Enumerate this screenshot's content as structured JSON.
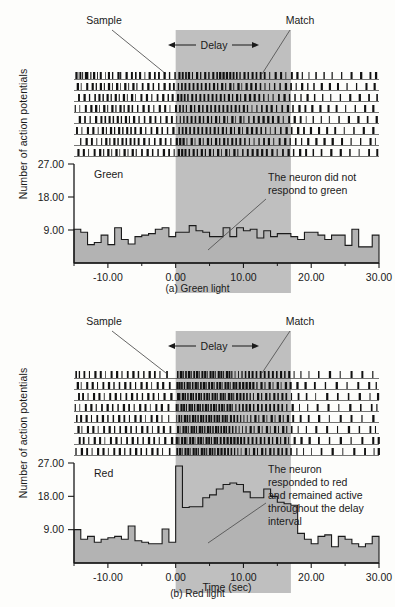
{
  "figure": {
    "y_axis_label": "Number of action potentials",
    "x_axis_label": "Time (sec)"
  },
  "panels": [
    {
      "id": "green",
      "caption": "(a) Green light",
      "condition_label": "Green",
      "annotation_lines": [
        "The neuron did not",
        "respond to green"
      ],
      "markers": {
        "sample": "Sample",
        "delay": "Delay",
        "match": "Match"
      }
    },
    {
      "id": "red",
      "caption": "(b) Red light",
      "condition_label": "Red",
      "annotation_lines": [
        "The neuron",
        "responded to red",
        "and remained active",
        "throughout the delay",
        "interval"
      ],
      "markers": {
        "sample": "Sample",
        "delay": "Delay",
        "match": "Match"
      }
    }
  ],
  "chart_data": [
    {
      "type": "bar",
      "id": "green-histogram",
      "title": "Green",
      "xlabel": "Time (sec)",
      "ylabel": "Number of action potentials",
      "xlim": [
        -15,
        30
      ],
      "ylim": [
        0,
        27
      ],
      "xticks": [
        -10,
        0,
        10,
        20,
        30
      ],
      "xtick_labels": [
        "-10.00",
        "0.00",
        "10.00",
        "20.00",
        "30.00"
      ],
      "yticks": [
        9,
        18,
        27
      ],
      "ytick_labels": [
        "9.00",
        "18.00",
        "27.00"
      ],
      "minor_xticks": [
        -15,
        -5,
        5,
        15,
        25
      ],
      "bin_width": 1,
      "bin_starts": [
        -15,
        -14,
        -13,
        -12,
        -11,
        -10,
        -9,
        -8,
        -7,
        -6,
        -5,
        -4,
        -3,
        -2,
        -1,
        0,
        1,
        2,
        3,
        4,
        5,
        6,
        7,
        8,
        9,
        10,
        11,
        12,
        13,
        14,
        15,
        16,
        17,
        18,
        19,
        20,
        21,
        22,
        23,
        24,
        25,
        26,
        27,
        28,
        29
      ],
      "values": [
        9.2,
        8.4,
        5.0,
        5.6,
        7.6,
        5.0,
        9.6,
        6.4,
        5.2,
        7.2,
        7.6,
        8.0,
        9.2,
        9.6,
        7.2,
        8.4,
        8.4,
        10.2,
        8.8,
        8.4,
        7.2,
        7.2,
        9.6,
        7.2,
        9.6,
        8.8,
        9.2,
        6.8,
        8.8,
        7.2,
        8.0,
        8.0,
        7.2,
        6.4,
        8.4,
        8.4,
        7.6,
        6.4,
        7.6,
        7.6,
        4.8,
        9.2,
        4.4,
        4.4,
        7.6
      ],
      "shaded_region": {
        "label": "Delay",
        "x_start": 0,
        "x_end": 17
      },
      "grid": false,
      "annotation": "The neuron did not respond to green"
    },
    {
      "type": "bar",
      "id": "red-histogram",
      "title": "Red",
      "xlabel": "Time (sec)",
      "ylabel": "Number of action potentials",
      "xlim": [
        -15,
        30
      ],
      "ylim": [
        0,
        27
      ],
      "xticks": [
        -10,
        0,
        10,
        20,
        30
      ],
      "xtick_labels": [
        "-10.00",
        "0.00",
        "10.00",
        "20.00",
        "30.00"
      ],
      "yticks": [
        9,
        18,
        27
      ],
      "ytick_labels": [
        "9.00",
        "18.00",
        "27.00"
      ],
      "minor_xticks": [
        -15,
        -5,
        5,
        15,
        25
      ],
      "bin_width": 1,
      "bin_starts": [
        -15,
        -14,
        -13,
        -12,
        -11,
        -10,
        -9,
        -8,
        -7,
        -6,
        -5,
        -4,
        -3,
        -2,
        -1,
        0,
        1,
        2,
        3,
        4,
        5,
        6,
        7,
        8,
        9,
        10,
        11,
        12,
        13,
        14,
        15,
        16,
        17,
        18,
        19,
        20,
        21,
        22,
        23,
        24,
        25,
        26,
        27,
        28,
        29
      ],
      "values": [
        9.0,
        6.4,
        7.2,
        5.6,
        6.4,
        6.8,
        7.2,
        6.4,
        10.0,
        6.0,
        5.6,
        5.2,
        5.2,
        9.2,
        5.6,
        26.2,
        15.0,
        15.2,
        15.2,
        17.6,
        18.4,
        20.0,
        21.2,
        21.6,
        21.2,
        19.2,
        17.6,
        17.6,
        20.0,
        18.0,
        16.4,
        16.0,
        15.6,
        8.0,
        6.4,
        5.2,
        7.2,
        7.6,
        4.4,
        7.2,
        6.4,
        5.2,
        4.4,
        5.2,
        7.2
      ],
      "shaded_region": {
        "label": "Delay",
        "x_start": 0,
        "x_end": 17
      },
      "grid": false,
      "annotation": "The neuron responded to red and remained active throughout the delay interval"
    }
  ],
  "raster": {
    "rows": 8,
    "green": [
      [
        -14.8,
        -14.5,
        -14.2,
        -13.8,
        -13.4,
        -13.1,
        -12.6,
        -12.2,
        -11.6,
        -11.2,
        -10.4,
        -10.0,
        -9.4,
        -8.6,
        -8.2,
        -7.4,
        -6.6,
        -6.0,
        -5.4,
        -4.6,
        -4.0,
        -3.2,
        -2.6,
        -1.8,
        -1.0,
        -0.2,
        0.4,
        0.9,
        1.4,
        1.8,
        2.4,
        3.0,
        3.6,
        4.2,
        4.8,
        5.4,
        6.0,
        6.4,
        6.9,
        7.4,
        7.9,
        8.4,
        8.9,
        9.4,
        10.0,
        10.6,
        11.2,
        11.8,
        12.4,
        13.0,
        13.8,
        14.6,
        15.4,
        16.2,
        17.0,
        17.8,
        18.6,
        19.6,
        20.6,
        21.8,
        23.0,
        24.4,
        25.8,
        27.2,
        28.6,
        29.4
      ],
      [
        -14.6,
        -14.0,
        -13.2,
        -12.4,
        -11.8,
        -11.2,
        -10.6,
        -10.0,
        -9.4,
        -8.8,
        -8.2,
        -7.6,
        -7.0,
        -6.4,
        -5.8,
        -5.0,
        -4.2,
        -3.4,
        -2.6,
        -1.8,
        -1.0,
        -0.4,
        0.3,
        0.8,
        1.3,
        1.9,
        2.5,
        3.1,
        3.7,
        4.3,
        4.9,
        5.5,
        6.1,
        6.7,
        7.3,
        7.9,
        8.5,
        9.1,
        9.7,
        10.3,
        11.0,
        11.7,
        12.4,
        13.1,
        13.8,
        14.5,
        15.3,
        16.1,
        16.9,
        17.7,
        18.5,
        19.4,
        20.3,
        21.4,
        22.6,
        23.8,
        25.2,
        26.6,
        28.0,
        29.2
      ],
      [
        -14.4,
        -13.6,
        -12.8,
        -12.0,
        -11.4,
        -10.8,
        -10.2,
        -9.6,
        -9.0,
        -8.4,
        -7.8,
        -7.2,
        -6.6,
        -6.0,
        -5.2,
        -4.4,
        -3.6,
        -2.8,
        -2.0,
        -1.2,
        -0.6,
        0.2,
        0.7,
        1.2,
        1.7,
        2.3,
        2.9,
        3.5,
        4.1,
        4.7,
        5.3,
        5.9,
        6.5,
        7.1,
        7.7,
        8.3,
        8.9,
        9.5,
        10.1,
        10.8,
        11.5,
        12.2,
        12.9,
        13.6,
        14.3,
        15.1,
        15.9,
        16.7,
        17.5,
        18.4,
        19.3,
        20.4,
        21.6,
        22.8,
        24.2,
        25.6,
        27.0,
        28.4,
        29.6
      ],
      [
        -14.9,
        -14.2,
        -13.4,
        -12.6,
        -11.9,
        -11.3,
        -10.7,
        -10.1,
        -9.5,
        -8.9,
        -8.3,
        -7.7,
        -7.1,
        -6.5,
        -5.7,
        -4.9,
        -4.1,
        -3.3,
        -2.5,
        -1.7,
        -0.9,
        -0.1,
        0.5,
        1.0,
        1.5,
        2.1,
        2.7,
        3.3,
        3.9,
        4.5,
        5.1,
        5.7,
        6.3,
        6.9,
        7.5,
        8.1,
        8.7,
        9.3,
        9.9,
        10.5,
        11.2,
        11.9,
        12.6,
        13.3,
        14.0,
        14.8,
        15.6,
        16.4,
        17.2,
        18.1,
        19.0,
        20.0,
        21.2,
        22.4,
        23.6,
        25.0,
        26.4,
        27.8,
        29.0
      ],
      [
        -14.3,
        -13.5,
        -12.7,
        -11.9,
        -11.1,
        -10.5,
        -9.9,
        -9.3,
        -8.7,
        -8.1,
        -7.5,
        -6.9,
        -6.3,
        -5.5,
        -4.7,
        -3.9,
        -3.1,
        -2.3,
        -1.5,
        -0.7,
        0.1,
        0.6,
        1.1,
        1.6,
        2.2,
        2.8,
        3.4,
        4.0,
        4.6,
        5.2,
        5.8,
        6.4,
        7.0,
        7.6,
        8.2,
        8.8,
        9.4,
        10.0,
        10.7,
        11.4,
        12.1,
        12.8,
        13.5,
        14.2,
        15.0,
        15.8,
        16.6,
        17.4,
        18.3,
        19.2,
        20.2,
        21.4,
        22.6,
        24.0,
        25.4,
        26.8,
        28.2,
        29.5
      ],
      [
        -14.7,
        -13.9,
        -13.1,
        -12.3,
        -11.5,
        -10.9,
        -10.3,
        -9.7,
        -9.1,
        -8.5,
        -7.9,
        -7.3,
        -6.7,
        -6.1,
        -5.3,
        -4.5,
        -3.7,
        -2.9,
        -2.1,
        -1.3,
        -0.5,
        0.4,
        0.9,
        1.4,
        2.0,
        2.6,
        3.2,
        3.8,
        4.4,
        5.0,
        5.6,
        6.2,
        6.8,
        7.4,
        8.0,
        8.6,
        9.2,
        9.8,
        10.4,
        11.1,
        11.8,
        12.5,
        13.2,
        13.9,
        14.6,
        15.4,
        16.2,
        17.0,
        17.9,
        18.8,
        19.8,
        21.0,
        22.2,
        23.4,
        24.8,
        26.2,
        27.6,
        29.0
      ],
      [
        -14.1,
        -13.3,
        -12.5,
        -11.7,
        -11.0,
        -10.4,
        -9.8,
        -9.2,
        -8.6,
        -8.0,
        -7.4,
        -6.8,
        -6.2,
        -5.6,
        -4.8,
        -4.0,
        -3.2,
        -2.4,
        -1.6,
        -0.8,
        0.0,
        0.5,
        1.0,
        1.6,
        2.2,
        2.8,
        3.4,
        4.0,
        4.6,
        5.2,
        5.8,
        6.4,
        7.0,
        7.6,
        8.2,
        8.8,
        9.4,
        10.1,
        10.8,
        11.5,
        12.2,
        12.9,
        13.6,
        14.4,
        15.2,
        16.0,
        16.8,
        17.6,
        18.5,
        19.4,
        20.6,
        21.8,
        23.0,
        24.4,
        25.8,
        27.2,
        28.6,
        29.4
      ],
      [
        -14.5,
        -13.7,
        -12.9,
        -12.1,
        -11.3,
        -10.7,
        -10.1,
        -9.5,
        -8.9,
        -8.3,
        -7.7,
        -7.1,
        -6.5,
        -5.9,
        -5.1,
        -4.3,
        -3.5,
        -2.7,
        -1.9,
        -1.1,
        -0.3,
        0.3,
        0.8,
        1.3,
        1.9,
        2.5,
        3.1,
        3.7,
        4.3,
        4.9,
        5.5,
        6.1,
        6.7,
        7.3,
        7.9,
        8.5,
        9.1,
        9.8,
        10.5,
        11.2,
        11.9,
        12.6,
        13.3,
        14.1,
        14.9,
        15.7,
        16.5,
        17.3,
        18.2,
        19.1,
        20.2,
        21.4,
        22.8,
        24.2,
        25.6,
        27.0,
        28.4,
        29.6
      ]
    ],
    "red": [
      [
        -14.8,
        -14.3,
        -13.6,
        -12.8,
        -12.0,
        -11.2,
        -10.4,
        -9.6,
        -8.8,
        -8.0,
        -7.2,
        -6.4,
        -5.6,
        -4.8,
        -4.0,
        -3.2,
        -2.4,
        -1.4,
        0.2,
        0.6,
        1.0,
        1.4,
        1.8,
        2.2,
        2.6,
        3.0,
        3.4,
        3.8,
        4.2,
        4.6,
        5.0,
        5.4,
        5.8,
        6.2,
        6.6,
        7.0,
        7.4,
        7.8,
        8.2,
        8.7,
        9.2,
        9.7,
        10.2,
        10.7,
        11.2,
        11.8,
        12.4,
        13.0,
        13.6,
        14.2,
        14.8,
        15.4,
        16.0,
        16.6,
        17.4,
        18.4,
        19.6,
        21.0,
        22.6,
        24.2,
        25.8,
        27.4,
        29.0
      ],
      [
        -14.6,
        -14.0,
        -13.2,
        -12.4,
        -11.6,
        -10.8,
        -10.0,
        -9.2,
        -8.4,
        -7.6,
        -6.8,
        -6.0,
        -5.2,
        -4.4,
        -3.6,
        -2.8,
        -2.0,
        -1.0,
        0.1,
        0.4,
        0.8,
        1.2,
        1.6,
        2.0,
        2.4,
        2.8,
        3.2,
        3.6,
        4.0,
        4.4,
        4.8,
        5.2,
        5.6,
        6.0,
        6.4,
        6.8,
        7.2,
        7.6,
        8.0,
        8.4,
        8.8,
        9.3,
        9.8,
        10.3,
        10.8,
        11.3,
        11.9,
        12.5,
        13.1,
        13.7,
        14.3,
        14.9,
        15.5,
        16.1,
        16.8,
        17.8,
        19.0,
        20.4,
        22.0,
        23.6,
        25.2,
        26.8,
        28.4,
        29.5
      ],
      [
        -14.4,
        -13.8,
        -13.0,
        -12.2,
        -11.4,
        -10.6,
        -9.8,
        -9.0,
        -8.2,
        -7.4,
        -6.6,
        -5.8,
        -5.0,
        -4.2,
        -3.4,
        -2.6,
        -1.8,
        -0.8,
        0.2,
        0.5,
        0.9,
        1.3,
        1.7,
        2.1,
        2.5,
        2.9,
        3.3,
        3.7,
        4.1,
        4.5,
        4.9,
        5.3,
        5.7,
        6.1,
        6.5,
        6.9,
        7.3,
        7.7,
        8.1,
        8.5,
        8.9,
        9.4,
        9.9,
        10.4,
        10.9,
        11.4,
        12.0,
        12.6,
        13.2,
        13.8,
        14.4,
        15.0,
        15.6,
        16.2,
        17.0,
        18.0,
        19.2,
        20.6,
        22.2,
        23.8,
        25.4,
        27.0,
        28.6,
        29.7
      ],
      [
        -14.9,
        -14.2,
        -13.4,
        -12.6,
        -11.8,
        -11.0,
        -10.2,
        -9.4,
        -8.6,
        -7.8,
        -7.0,
        -6.2,
        -5.4,
        -4.6,
        -3.8,
        -3.0,
        -2.2,
        -1.2,
        0.0,
        0.3,
        0.7,
        1.1,
        1.5,
        1.9,
        2.3,
        2.7,
        3.1,
        3.5,
        3.9,
        4.3,
        4.7,
        5.1,
        5.5,
        5.9,
        6.3,
        6.7,
        7.1,
        7.5,
        7.9,
        8.3,
        8.8,
        9.3,
        9.8,
        10.3,
        10.8,
        11.4,
        12.0,
        12.6,
        13.2,
        13.8,
        14.4,
        15.0,
        15.6,
        16.3,
        17.1,
        18.2,
        19.4,
        20.8,
        22.4,
        24.0,
        25.6,
        27.2,
        28.8,
        29.6
      ],
      [
        -14.7,
        -14.1,
        -13.3,
        -12.5,
        -11.7,
        -10.9,
        -10.1,
        -9.3,
        -8.5,
        -7.7,
        -6.9,
        -6.1,
        -5.3,
        -4.5,
        -3.7,
        -2.9,
        -2.1,
        -1.1,
        0.1,
        0.4,
        0.8,
        1.2,
        1.6,
        2.0,
        2.4,
        2.8,
        3.2,
        3.6,
        4.0,
        4.4,
        4.8,
        5.2,
        5.6,
        6.0,
        6.4,
        6.8,
        7.2,
        7.6,
        8.0,
        8.5,
        9.0,
        9.5,
        10.0,
        10.5,
        11.0,
        11.6,
        12.2,
        12.8,
        13.4,
        14.0,
        14.6,
        15.2,
        15.8,
        16.4,
        17.2,
        18.3,
        19.5,
        21.0,
        22.6,
        24.2,
        25.8,
        27.4,
        29.0
      ],
      [
        -14.5,
        -13.9,
        -13.1,
        -12.3,
        -11.5,
        -10.7,
        -9.9,
        -9.1,
        -8.3,
        -7.5,
        -6.7,
        -5.9,
        -5.1,
        -4.3,
        -3.5,
        -2.7,
        -1.9,
        -0.9,
        0.2,
        0.6,
        1.0,
        1.4,
        1.8,
        2.2,
        2.6,
        3.0,
        3.4,
        3.8,
        4.2,
        4.6,
        5.0,
        5.4,
        5.8,
        6.2,
        6.6,
        7.0,
        7.4,
        7.8,
        8.3,
        8.8,
        9.3,
        9.8,
        10.3,
        10.9,
        11.5,
        12.1,
        12.7,
        13.3,
        13.9,
        14.5,
        15.1,
        15.7,
        16.3,
        17.0,
        18.0,
        19.2,
        20.6,
        22.2,
        23.8,
        25.4,
        27.0,
        28.6,
        29.4
      ],
      [
        -14.3,
        -13.7,
        -12.9,
        -12.1,
        -11.3,
        -10.5,
        -9.7,
        -8.9,
        -8.1,
        -7.3,
        -6.5,
        -5.7,
        -4.9,
        -4.1,
        -3.3,
        -2.5,
        -1.7,
        -0.7,
        0.0,
        0.4,
        0.8,
        1.2,
        1.6,
        2.0,
        2.4,
        2.8,
        3.2,
        3.6,
        4.0,
        4.4,
        4.8,
        5.2,
        5.6,
        6.0,
        6.5,
        7.0,
        7.5,
        8.0,
        8.5,
        9.0,
        9.5,
        10.0,
        10.6,
        11.2,
        11.8,
        12.4,
        13.0,
        13.6,
        14.2,
        14.8,
        15.4,
        16.0,
        16.6,
        17.4,
        18.4,
        19.6,
        21.0,
        22.6,
        24.2,
        25.8,
        27.4,
        29.0,
        29.8
      ],
      [
        -14.8,
        -14.0,
        -13.2,
        -12.4,
        -11.6,
        -10.8,
        -10.0,
        -9.2,
        -8.4,
        -7.6,
        -6.8,
        -6.0,
        -5.2,
        -4.4,
        -3.6,
        -2.8,
        -2.0,
        -1.0,
        0.1,
        0.5,
        0.9,
        1.3,
        1.7,
        2.1,
        2.5,
        2.9,
        3.3,
        3.7,
        4.1,
        4.5,
        4.9,
        5.3,
        5.7,
        6.1,
        6.6,
        7.1,
        7.6,
        8.1,
        8.6,
        9.1,
        9.6,
        10.2,
        10.8,
        11.4,
        12.0,
        12.6,
        13.2,
        13.8,
        14.4,
        15.0,
        15.6,
        16.2,
        16.9,
        17.8,
        18.8,
        20.0,
        21.4,
        23.0,
        24.6,
        26.2,
        27.8,
        29.2,
        29.8
      ]
    ]
  },
  "colors": {
    "delay_band": "#bfbfbf",
    "histogram_fill": "#b3b3b3",
    "histogram_stroke": "#1a1a1a",
    "axis": "#1a1a1a",
    "background": "#fdfdfb",
    "leader_line": "#555555"
  }
}
